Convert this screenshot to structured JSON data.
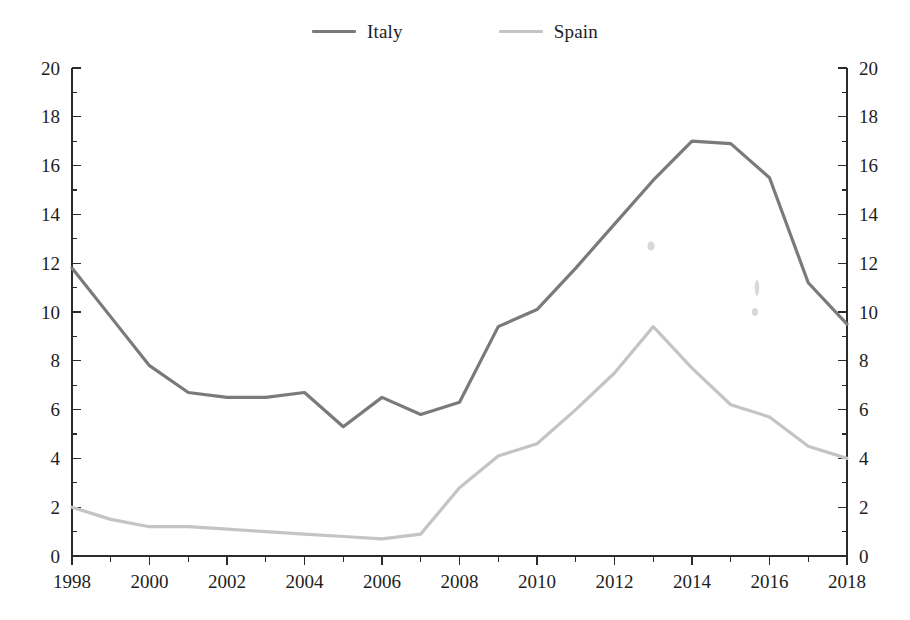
{
  "legend": {
    "position": "top-center",
    "entries": [
      {
        "label": "Italy",
        "color": "#7a7a7a",
        "icon": "line-swatch-icon"
      },
      {
        "label": "Spain",
        "color": "#c4c4c4",
        "icon": "line-swatch-icon"
      }
    ]
  },
  "axes": {
    "y_left_ticks": [
      "0",
      "2",
      "4",
      "6",
      "8",
      "10",
      "12",
      "14",
      "16",
      "18",
      "20"
    ],
    "y_right_ticks": [
      "0",
      "2",
      "4",
      "6",
      "8",
      "10",
      "12",
      "14",
      "16",
      "18",
      "20"
    ],
    "x_ticks": [
      "1998",
      "2000",
      "2002",
      "2004",
      "2006",
      "2008",
      "2010",
      "2012",
      "2014",
      "2016",
      "2018"
    ]
  },
  "chart_data": {
    "type": "line",
    "title": "",
    "subtitle": "",
    "xlabel": "",
    "ylabel": "",
    "xlim": [
      1998,
      2018
    ],
    "ylim": [
      0,
      20
    ],
    "ytick_step": 2,
    "yminor_step": 1,
    "xtick_step": 2,
    "xminor_step": 1,
    "grid": false,
    "dual_axis": true,
    "legend_position": "top-center",
    "x": [
      1998,
      1999,
      2000,
      2001,
      2002,
      2003,
      2004,
      2005,
      2006,
      2007,
      2008,
      2009,
      2010,
      2011,
      2012,
      2013,
      2014,
      2015,
      2016,
      2017,
      2018
    ],
    "series": [
      {
        "name": "Italy",
        "color": "#7a7a7a",
        "values": [
          11.8,
          9.8,
          7.8,
          6.7,
          6.5,
          6.5,
          6.7,
          5.3,
          6.5,
          5.8,
          6.3,
          9.4,
          10.1,
          11.8,
          13.6,
          15.4,
          17.0,
          16.9,
          15.5,
          11.2,
          9.5
        ]
      },
      {
        "name": "Spain",
        "color": "#c4c4c4",
        "values": [
          2.0,
          1.5,
          1.2,
          1.2,
          1.1,
          1.0,
          0.9,
          0.8,
          0.7,
          0.9,
          2.8,
          4.1,
          4.6,
          6.0,
          7.5,
          9.4,
          7.7,
          6.2,
          5.7,
          4.5,
          4.0
        ]
      }
    ]
  }
}
